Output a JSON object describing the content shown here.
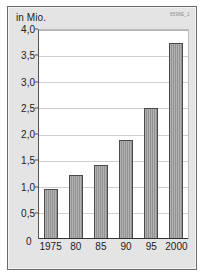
{
  "chart_data": {
    "type": "bar",
    "title": "in Mio.",
    "xlabel": "",
    "ylabel": "in Mio.",
    "categories": [
      "1975",
      "80",
      "85",
      "90",
      "95",
      "2000"
    ],
    "values": [
      0.95,
      1.23,
      1.42,
      1.9,
      2.5,
      3.75
    ],
    "ylim": [
      0,
      4.0
    ],
    "ytick_labels": [
      "0",
      "0,5",
      "1,0",
      "1,5",
      "2,0",
      "2,5",
      "3,0",
      "3,5",
      "4,0"
    ],
    "ytick_values": [
      0,
      0.5,
      1.0,
      1.5,
      2.0,
      2.5,
      3.0,
      3.5,
      4.0
    ],
    "grid": true,
    "legend": "none",
    "series": [
      {
        "name": "in Mio.",
        "values": [
          0.95,
          1.23,
          1.42,
          1.9,
          2.5,
          3.75
        ]
      }
    ],
    "bar_color": "#9a9a9a",
    "bar_edge_color": "#4a4a4a",
    "plot_background": "#ffffff",
    "panel_background": "#e4e4e4",
    "gridline_color": "#cfcfcf"
  },
  "header": {
    "axis_unit_label": "in Mio.",
    "reference_code": "8598E_1"
  }
}
